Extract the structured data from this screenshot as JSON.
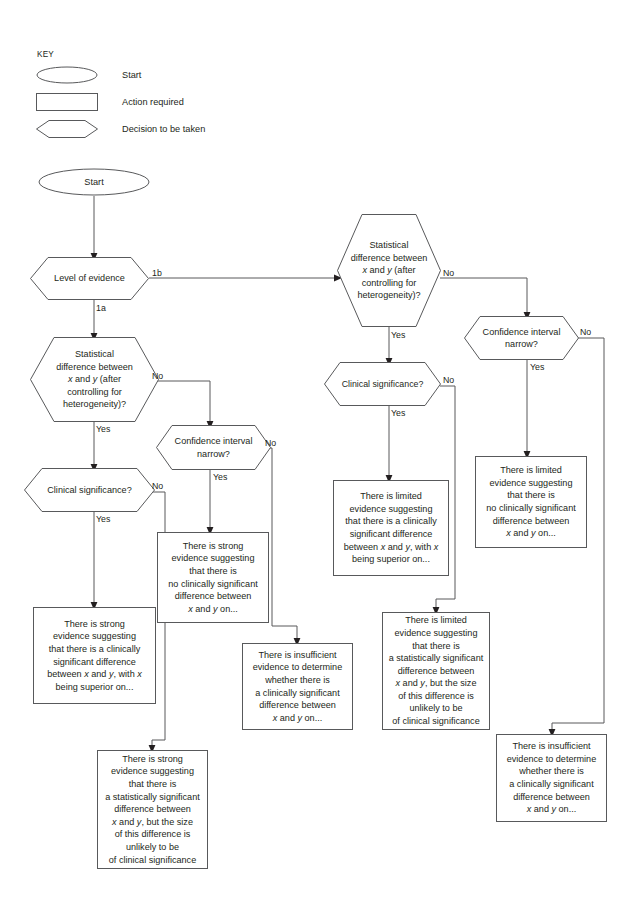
{
  "diagram": {
    "key": {
      "title": "KEY",
      "items": [
        {
          "shape": "oval",
          "label": "Start"
        },
        {
          "shape": "rect",
          "label": "Action required"
        },
        {
          "shape": "hexagon",
          "label": "Decision to be taken"
        }
      ]
    },
    "nodes": {
      "start": {
        "type": "oval",
        "text": "Start"
      },
      "level": {
        "type": "hexagon",
        "text": "Level of evidence"
      },
      "stat_left": {
        "type": "hexagon",
        "text": "Statistical difference between x and y (after controlling for heterogeneity)?"
      },
      "clin_left": {
        "type": "hexagon",
        "text": "Clinical significance?"
      },
      "ci_left": {
        "type": "hexagon",
        "text": "Confidence interval narrow?"
      },
      "stat_right": {
        "type": "hexagon",
        "text": "Statistical difference between x and y (after controlling for heterogeneity)?"
      },
      "clin_right": {
        "type": "hexagon",
        "text": "Clinical significance?"
      },
      "ci_right": {
        "type": "hexagon",
        "text": "Confidence interval narrow?"
      },
      "out_strong_clin": {
        "type": "action",
        "text": "There is strong evidence suggesting that there is a clinically significant difference between x and y, with x being superior on..."
      },
      "out_strong_stat": {
        "type": "action",
        "text": "There is strong evidence suggesting that there is a statistically significant difference between x and y, but the size of this difference is unlikely to be of clinical significance"
      },
      "out_strong_noclin": {
        "type": "action",
        "text": "There is strong evidence suggesting that there is no clinically significant difference between x and y on..."
      },
      "out_insuff_left": {
        "type": "action",
        "text": "There is insufficient evidence to determine whether there is a clinically significant difference between x and y on..."
      },
      "out_limited_clin": {
        "type": "action",
        "text": "There is limited evidence suggesting that there is a clinically significant difference between x and y, with x being superior on..."
      },
      "out_limited_stat": {
        "type": "action",
        "text": "There is limited evidence suggesting that there is a statistically significant difference between x and y, but the size of this difference is unlikely to be of clinical significance"
      },
      "out_limited_noclin": {
        "type": "action",
        "text": "There is limited evidence suggesting that there is no clinically significant difference between x and y on..."
      },
      "out_insuff_right": {
        "type": "action",
        "text": "There is insufficient evidence to determine whether there is a clinically significant difference between x and y on..."
      }
    },
    "edge_labels": {
      "level_1b": "1b",
      "level_1a": "1a",
      "stat_left_no": "No",
      "stat_left_yes": "Yes",
      "clin_left_no": "No",
      "clin_left_yes": "Yes",
      "ci_left_no": "No",
      "ci_left_yes": "Yes",
      "stat_right_no": "No",
      "stat_right_yes": "Yes",
      "clin_right_no": "No",
      "clin_right_yes": "Yes",
      "ci_right_no": "No",
      "ci_right_yes": "Yes"
    },
    "colors": {
      "stroke": "#58595b",
      "text": "#231f20",
      "background": "#ffffff"
    }
  }
}
